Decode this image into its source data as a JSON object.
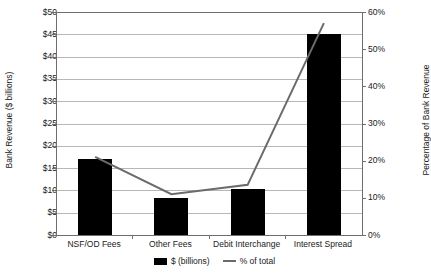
{
  "chart_data": {
    "type": "bar",
    "title": "",
    "categories": [
      "NSF/OD Fees",
      "Other Fees",
      "Debit Interchange",
      "Interest Spread"
    ],
    "series": [
      {
        "name": "$ (billions)",
        "type": "bar",
        "axis": "left",
        "color": "#000000",
        "values": [
          17.0,
          8.4,
          10.4,
          45.0
        ]
      },
      {
        "name": "% of total",
        "type": "line",
        "axis": "right",
        "color": "#6b6b6b",
        "values": [
          21,
          11,
          13.5,
          57
        ]
      }
    ],
    "xlabel": "",
    "ylabel": "Bank Revenue ($ billions)",
    "y2label": "Percentage of Bank Revenue",
    "ylim": [
      0,
      50
    ],
    "y2lim": [
      0,
      60
    ],
    "yticks": [
      "$0",
      "$5",
      "$10",
      "$15",
      "$20",
      "$25",
      "$30",
      "$35",
      "$40",
      "$45",
      "$50"
    ],
    "ytick_values": [
      0,
      5,
      10,
      15,
      20,
      25,
      30,
      35,
      40,
      45,
      50
    ],
    "y2ticks": [
      "0%",
      "10%",
      "20%",
      "30%",
      "40%",
      "50%",
      "60%"
    ],
    "y2tick_values": [
      0,
      10,
      20,
      30,
      40,
      50,
      60
    ],
    "grid": true,
    "legend_position": "bottom",
    "legend": [
      "$ (billions)",
      "% of total"
    ]
  },
  "axes": {
    "left_title": "Bank Revenue ($ billions)",
    "right_title": "Percentage of Bank Revenue"
  },
  "legend": {
    "bar_label": "$ (billions)",
    "line_label": "% of total"
  },
  "colors": {
    "bar": "#000000",
    "line": "#6b6b6b",
    "grid": "#b7b7b7",
    "axis": "#6e6e6e",
    "text": "#1a1a1a",
    "background": "#ffffff"
  }
}
